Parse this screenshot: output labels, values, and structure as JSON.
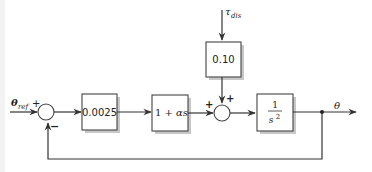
{
  "diagram": {
    "type": "control-system-block-diagram",
    "input": {
      "symbol": "θ",
      "subscript": "ref"
    },
    "disturbance": {
      "symbol": "τ",
      "subscript": "dis"
    },
    "output": {
      "symbol": "θ"
    },
    "blocks": [
      {
        "id": "gain",
        "label": "0.0025"
      },
      {
        "id": "lead",
        "label_pre": "1 + ",
        "label_var": "αs"
      },
      {
        "id": "dist_gain",
        "label": "0.10"
      },
      {
        "id": "plant",
        "numerator": "1",
        "denominator": "s",
        "denominator_exp": "2"
      }
    ],
    "summing_junctions": [
      {
        "id": "sum1",
        "signs": {
          "left": "+",
          "bottom": "−"
        }
      },
      {
        "id": "sum2",
        "signs": {
          "left": "+",
          "top": "+"
        }
      }
    ],
    "edges": [
      "θref → sum1 (+)",
      "sum1 → 0.0025",
      "0.0025 → 1 + αs",
      "1 + αs → sum2 (+)",
      "τdis → 0.10",
      "0.10 → sum2 (+)",
      "sum2 → 1/s²",
      "1/s² → θ",
      "θ → sum1 (−) feedback"
    ]
  }
}
